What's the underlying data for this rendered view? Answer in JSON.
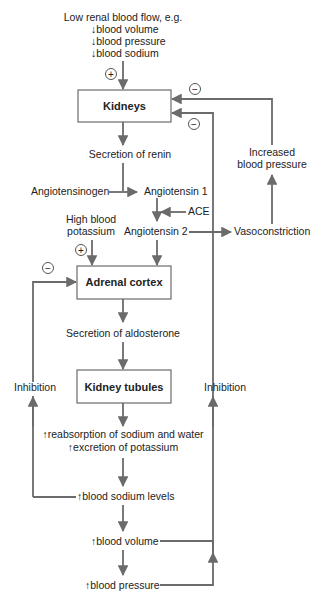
{
  "diagram": {
    "colors": {
      "line": "#6b6b6b",
      "text": "#222222",
      "box_border": "#6b6b6b",
      "background": "#ffffff"
    },
    "trigger": {
      "heading": "Low renal blood flow, e.g.",
      "items": [
        "↓blood volume",
        "↓blood pressure",
        "↓blood sodium"
      ]
    },
    "boxes": {
      "kidneys": "Kidneys",
      "adrenal_cortex": "Adrenal cortex",
      "kidney_tubules": "Kidney tubules"
    },
    "nodes": {
      "secretion_renin": "Secretion of renin",
      "angiotensinogen": "Angiotensinogen",
      "angiotensin1": "Angiotensin 1",
      "ace": "ACE",
      "angiotensin2": "Angiotensin 2",
      "vasoconstriction": "Vasoconstriction",
      "increased_bp_line1": "Increased",
      "increased_bp_line2": "blood pressure",
      "high_potassium_line1": "High blood",
      "high_potassium_line2": "potassium",
      "secretion_aldosterone": "Secretion of aldosterone",
      "reabsorption": "↑reabsorption of sodium and water",
      "excretion": "↑excretion of potassium",
      "blood_sodium_levels": "↑blood sodium levels",
      "blood_volume": "↑blood volume",
      "blood_pressure": "↑blood pressure",
      "inhibition_left": "Inhibition",
      "inhibition_right": "Inhibition"
    },
    "symbols": {
      "plus": "+",
      "minus": "−"
    }
  }
}
